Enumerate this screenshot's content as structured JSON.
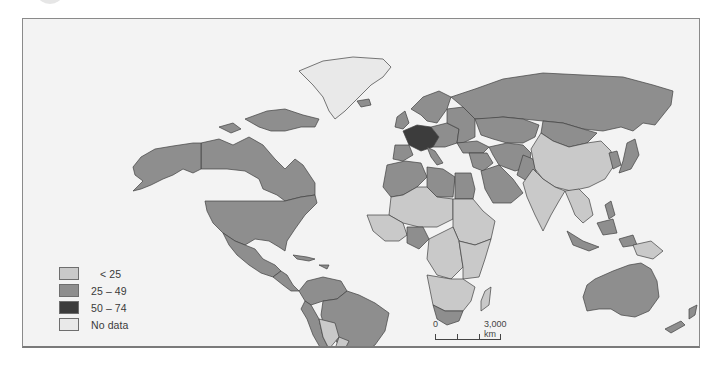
{
  "map": {
    "title": "",
    "palette": {
      "lt25": "#c9c9c9",
      "25to49": "#8e8e8e",
      "50to74": "#3c3c3c",
      "nodata": "#e9e9e9",
      "ocean": "#f3f3f3",
      "border": "#404040"
    },
    "legend": {
      "items": [
        {
          "key": "lt25",
          "label": "< 25"
        },
        {
          "key": "25to49",
          "label": "25 – 49"
        },
        {
          "key": "50to74",
          "label": "50 – 74"
        },
        {
          "key": "nodata",
          "label": "No data"
        }
      ]
    },
    "scale_bar": {
      "zero_label": "0",
      "max_label": "3,000 km"
    },
    "regions": [
      {
        "name": "canada",
        "category": "25to49"
      },
      {
        "name": "alaska",
        "category": "25to49"
      },
      {
        "name": "canadian-arctic-islands",
        "category": "25to49"
      },
      {
        "name": "greenland",
        "category": "nodata"
      },
      {
        "name": "usa",
        "category": "25to49"
      },
      {
        "name": "mexico",
        "category": "25to49"
      },
      {
        "name": "central-america",
        "category": "25to49"
      },
      {
        "name": "caribbean",
        "category": "25to49"
      },
      {
        "name": "colombia-venezuela",
        "category": "25to49"
      },
      {
        "name": "brazil",
        "category": "25to49"
      },
      {
        "name": "peru",
        "category": "25to49"
      },
      {
        "name": "bolivia",
        "category": "lt25"
      },
      {
        "name": "paraguay",
        "category": "lt25"
      },
      {
        "name": "argentina-chile",
        "category": "25to49"
      },
      {
        "name": "iceland",
        "category": "25to49"
      },
      {
        "name": "uk-ireland",
        "category": "25to49"
      },
      {
        "name": "scandinavia",
        "category": "25to49"
      },
      {
        "name": "western-europe",
        "category": "50to74"
      },
      {
        "name": "central-europe",
        "category": "25to49"
      },
      {
        "name": "iberia",
        "category": "25to49"
      },
      {
        "name": "italy",
        "category": "25to49"
      },
      {
        "name": "eastern-europe",
        "category": "25to49"
      },
      {
        "name": "russia",
        "category": "25to49"
      },
      {
        "name": "kazakhstan-central-asia",
        "category": "25to49"
      },
      {
        "name": "turkey",
        "category": "25to49"
      },
      {
        "name": "middle-east",
        "category": "25to49"
      },
      {
        "name": "saudi-arabia",
        "category": "25to49"
      },
      {
        "name": "iran-afghanistan",
        "category": "25to49"
      },
      {
        "name": "pakistan",
        "category": "25to49"
      },
      {
        "name": "mongolia",
        "category": "25to49"
      },
      {
        "name": "china",
        "category": "lt25"
      },
      {
        "name": "india",
        "category": "lt25"
      },
      {
        "name": "southeast-asia",
        "category": "lt25"
      },
      {
        "name": "korea",
        "category": "25to49"
      },
      {
        "name": "japan",
        "category": "25to49"
      },
      {
        "name": "indonesia",
        "category": "25to49"
      },
      {
        "name": "philippines",
        "category": "25to49"
      },
      {
        "name": "papua-new-guinea",
        "category": "lt25"
      },
      {
        "name": "australia",
        "category": "25to49"
      },
      {
        "name": "new-zealand",
        "category": "25to49"
      },
      {
        "name": "north-africa-west",
        "category": "25to49"
      },
      {
        "name": "libya",
        "category": "25to49"
      },
      {
        "name": "egypt",
        "category": "25to49"
      },
      {
        "name": "sahel",
        "category": "lt25"
      },
      {
        "name": "west-africa",
        "category": "lt25"
      },
      {
        "name": "nigeria",
        "category": "25to49"
      },
      {
        "name": "sudan-ethiopia",
        "category": "lt25"
      },
      {
        "name": "central-africa",
        "category": "lt25"
      },
      {
        "name": "east-africa",
        "category": "lt25"
      },
      {
        "name": "southern-africa",
        "category": "lt25"
      },
      {
        "name": "south-africa",
        "category": "25to49"
      },
      {
        "name": "madagascar",
        "category": "lt25"
      }
    ]
  }
}
